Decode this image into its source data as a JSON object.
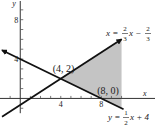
{
  "chart_data": {
    "type": "line",
    "title": "",
    "xlabel": "x",
    "ylabel": "y",
    "xlim": [
      -2,
      13.5
    ],
    "ylim": [
      -2.7,
      10
    ],
    "grid": false,
    "x_tick_step": 1,
    "y_tick_step": 1,
    "x_tick_labels": [
      {
        "value": 4,
        "text": "4"
      },
      {
        "value": 8,
        "text": "8"
      }
    ],
    "y_tick_labels": [
      {
        "value": 4,
        "text": "4"
      },
      {
        "value": 8,
        "text": "8"
      }
    ],
    "axis_labels": {
      "x": "x",
      "y": "y"
    },
    "series": [
      {
        "name": "y = (2/3)x - 2/3",
        "label_parts": {
          "lhs": "x = ",
          "num1": "2",
          "den1": "3",
          "mid": "x − ",
          "num2": "2",
          "den2": "3"
        },
        "slope": 0.6667,
        "intercept": -0.6667,
        "x": [
          -1.8,
          10.0
        ],
        "arrow": "end"
      },
      {
        "name": "y = (1/2)x + 4",
        "label_parts": {
          "lhs": "y = ",
          "num1": "1",
          "den1": "2",
          "mid": "x + 4"
        },
        "slope": -0.5,
        "intercept": 4,
        "x": [
          -1.8,
          10.2
        ],
        "arrow": "start"
      }
    ],
    "shaded_region": {
      "vertices": [
        [
          4,
          2
        ],
        [
          10,
          6
        ],
        [
          10,
          -1
        ]
      ],
      "color": "#c4c4c4"
    },
    "annotations": [
      {
        "text": "(4, 2)",
        "point": [
          4,
          2
        ]
      },
      {
        "text": "(8, 0)",
        "point": [
          8,
          0
        ]
      }
    ]
  }
}
